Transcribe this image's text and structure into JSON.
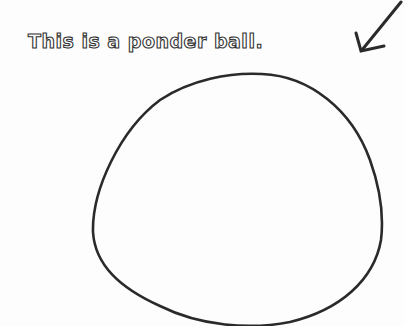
{
  "caption": "This is a ponder ball.",
  "colors": {
    "ink": "#2a2a2a",
    "background": "#fdfdfd"
  },
  "icons": {
    "arrow": "arrow-down-left-icon",
    "ball": "ponder-ball-outline"
  }
}
